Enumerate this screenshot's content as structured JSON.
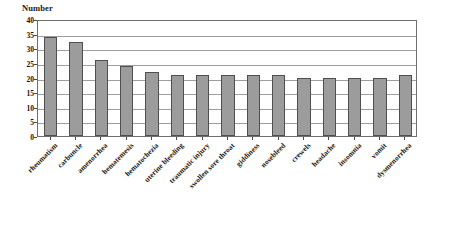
{
  "chart_data": {
    "type": "bar",
    "title": "",
    "ylabel": "Number",
    "xlabel": "",
    "ylim": [
      0,
      40
    ],
    "yticks": [
      0,
      5,
      10,
      15,
      20,
      25,
      30,
      35,
      40
    ],
    "grid": true,
    "legend": "none",
    "orientation": "vertical",
    "bar_color": "#9c9c9c",
    "bar_edge_color": "#4f4f4f",
    "categories": [
      "rheumatism",
      "carbuncle",
      "amenorrhea",
      "hematemesis",
      "hematochezia",
      "uterine bleeding",
      "traumatic injury",
      "swollen sore throat",
      "giddiness",
      "nosebleed",
      "crewels",
      "headache",
      "insomnia",
      "vomit",
      "dysmenorrhea"
    ],
    "values": [
      34,
      32,
      26,
      24,
      22,
      21,
      21,
      21,
      21,
      21,
      20,
      20,
      20,
      20,
      21
    ],
    "series": [
      {
        "name": "Number",
        "values": [
          34,
          32,
          26,
          24,
          22,
          21,
          21,
          21,
          21,
          21,
          20,
          20,
          20,
          20,
          21
        ]
      }
    ]
  },
  "axis": {
    "y_title": "Number",
    "tick_labels": [
      "40",
      "35",
      "30",
      "25",
      "20",
      "15",
      "10",
      "5",
      "0"
    ]
  }
}
